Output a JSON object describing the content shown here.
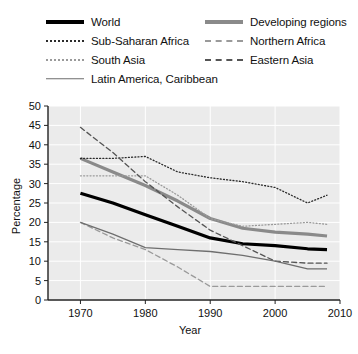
{
  "chart_data": {
    "type": "line",
    "title": "",
    "xlabel": "Year",
    "ylabel": "Percentage",
    "xlim": [
      1965,
      2010
    ],
    "ylim": [
      0,
      50
    ],
    "xticks": [
      1970,
      1980,
      1990,
      2000,
      2010
    ],
    "yticks": [
      0,
      5,
      10,
      15,
      20,
      25,
      30,
      35,
      40,
      45,
      50
    ],
    "grid": true,
    "legend_position": "above-plot",
    "x": [
      1970,
      1975,
      1980,
      1985,
      1990,
      1995,
      2000,
      2005,
      2008
    ],
    "series": [
      {
        "name": "World",
        "style": "solid",
        "width": "thick",
        "color": "#000000",
        "values": [
          27.5,
          25.0,
          22.0,
          19.0,
          16.0,
          14.5,
          14.0,
          13.2,
          13.0
        ]
      },
      {
        "name": "Developing regions",
        "style": "solid",
        "width": "thick",
        "color": "#8a8a8a",
        "values": [
          36.5,
          33.0,
          29.5,
          25.5,
          21.0,
          18.5,
          17.5,
          17.0,
          16.5
        ]
      },
      {
        "name": "Sub-Saharan Africa",
        "style": "dotted",
        "width": "thin",
        "color": "#2b2b2b",
        "values": [
          36.5,
          36.5,
          37.0,
          33.0,
          31.5,
          30.5,
          29.0,
          25.0,
          27.0
        ]
      },
      {
        "name": "Northern Africa",
        "style": "dashed",
        "width": "thin",
        "color": "#9a9a9a",
        "values": [
          20.0,
          16.0,
          13.0,
          8.5,
          3.5,
          3.5,
          3.5,
          3.5,
          3.5
        ]
      },
      {
        "name": "South Asia",
        "style": "dotted",
        "width": "thin",
        "color": "#9a9a9a",
        "values": [
          32.0,
          32.0,
          32.0,
          27.0,
          21.0,
          19.0,
          19.5,
          20.0,
          19.5
        ]
      },
      {
        "name": "Eastern Asia",
        "style": "dashed",
        "width": "thin",
        "color": "#555555",
        "values": [
          44.5,
          38.0,
          30.5,
          24.0,
          18.0,
          14.0,
          10.0,
          9.5,
          9.5
        ]
      },
      {
        "name": "Latin America, Caribbean",
        "style": "solid",
        "width": "thin",
        "color": "#6e6e6e",
        "values": [
          20.0,
          17.0,
          13.5,
          13.0,
          12.5,
          11.5,
          10.0,
          8.0,
          8.0
        ]
      }
    ]
  },
  "legend": {
    "left_column": [
      {
        "label": "World",
        "swatch": "sw-world"
      },
      {
        "label": "Sub-Saharan Africa",
        "swatch": "sw-ssa"
      },
      {
        "label": "South Asia",
        "swatch": "sw-sa"
      },
      {
        "label": "Latin America, Caribbean",
        "swatch": "sw-lac"
      }
    ],
    "right_column": [
      {
        "label": "Developing regions",
        "swatch": "sw-dev"
      },
      {
        "label": "Northern Africa",
        "swatch": "sw-na"
      },
      {
        "label": "Eastern Asia",
        "swatch": "sw-ea"
      }
    ]
  },
  "axes": {
    "y_title": "Percentage",
    "x_title": "Year",
    "y_tick_labels": [
      "0",
      "5",
      "10",
      "15",
      "20",
      "25",
      "30",
      "35",
      "40",
      "45",
      "50"
    ],
    "x_tick_labels": [
      "1970",
      "1980",
      "1990",
      "2000",
      "2010"
    ]
  },
  "colors": {
    "plot_background": "#ebebeb",
    "grid": "#ffffff",
    "axis": "#222222",
    "text": "#111111"
  }
}
